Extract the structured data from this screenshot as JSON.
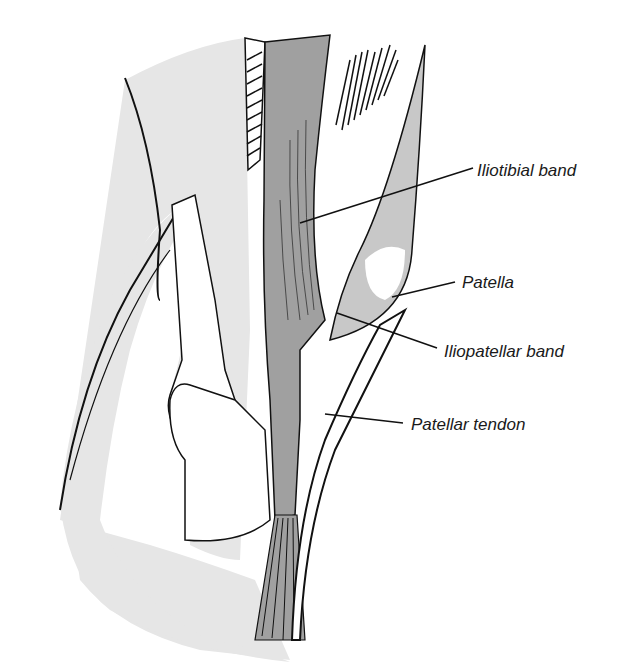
{
  "figure": {
    "colors": {
      "background": "#ffffff",
      "light_gray": "#e6e6e6",
      "mid_gray": "#a0a0a0",
      "line": "#111111"
    },
    "labels": [
      {
        "id": "iliotibial-band",
        "text": "Iliotibial band",
        "x": 477,
        "y": 162
      },
      {
        "id": "patella",
        "text": "Patella",
        "x": 462,
        "y": 274
      },
      {
        "id": "iliopatellar-band",
        "text": "Iliopatellar band",
        "x": 444,
        "y": 343
      },
      {
        "id": "patellar-tendon",
        "text": "Patellar tendon",
        "x": 411,
        "y": 416
      }
    ]
  }
}
